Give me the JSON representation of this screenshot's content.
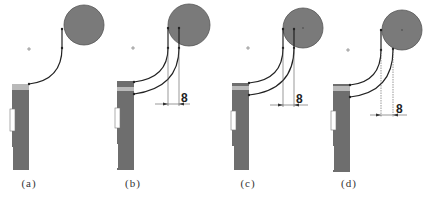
{
  "figure": {
    "colors": {
      "background": "#ffffff",
      "circle_fill": "#7a7a7a",
      "circle_stroke": "#555555",
      "bar_fill": "#6e6e6e",
      "bar_top_highlight": "#b9b9b9",
      "line": "#222222",
      "dim_line": "#555555"
    },
    "panels": [
      {
        "id": "a",
        "caption": "(a)",
        "dimension_label": null
      },
      {
        "id": "b",
        "caption": "(b)",
        "dimension_label": "8"
      },
      {
        "id": "c",
        "caption": "(c)",
        "dimension_label": "8"
      },
      {
        "id": "d",
        "caption": "(d)",
        "dimension_label": "8"
      }
    ]
  }
}
